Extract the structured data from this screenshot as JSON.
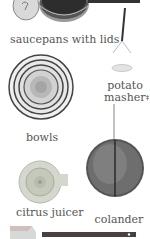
{
  "items": [
    {
      "id": "saucepans",
      "label": "saucepans with lids"
    },
    {
      "id": "potato-masher",
      "label_line1": "potato",
      "label_line2": "masher",
      "mark": "‡"
    },
    {
      "id": "bowls",
      "label": "bowls"
    },
    {
      "id": "citrus-juicer",
      "label": "citrus juicer"
    },
    {
      "id": "colander",
      "label": "colander"
    },
    {
      "id": "spatula",
      "label": ""
    }
  ],
  "colors": {
    "background": "#ffffff",
    "label_text": "#555555",
    "metal_dark": "#3a3a3a",
    "metal_mid": "#8a8a8a",
    "metal_light": "#d6d6d6",
    "juicer": "#cfd3c6",
    "spatula_handle": "#4a4040"
  }
}
